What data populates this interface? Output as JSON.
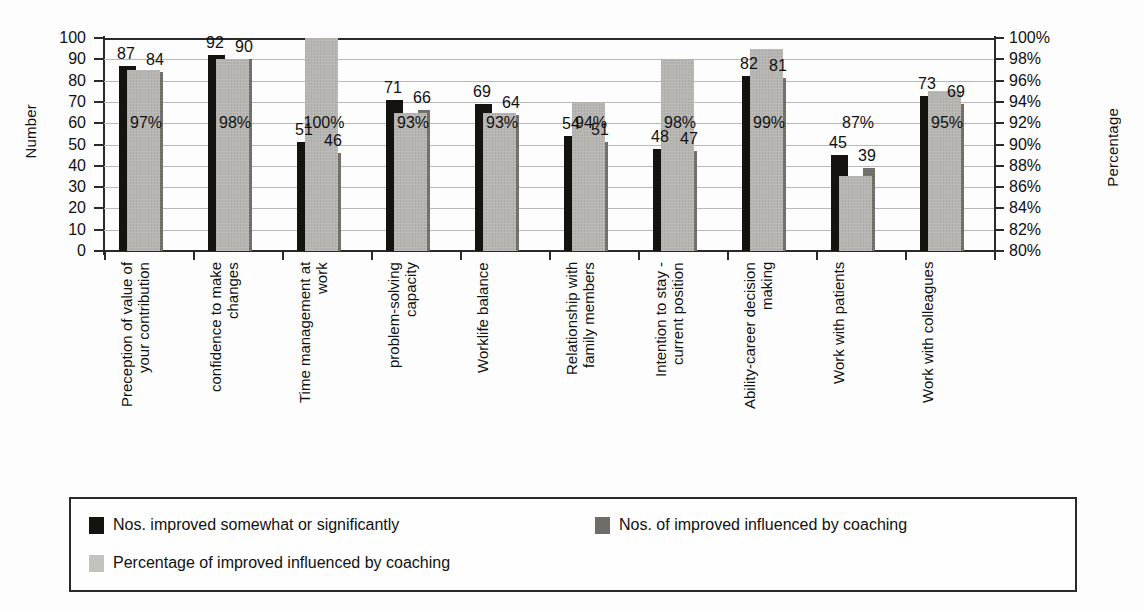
{
  "chart_data": {
    "type": "bar",
    "title": "",
    "subtitle": "",
    "xlabel": "",
    "ylabel": "Number",
    "y2label": "Percentage",
    "ylim": [
      0,
      100
    ],
    "y2lim": [
      80,
      100
    ],
    "ytick_step": 10,
    "y2tick_step": 2,
    "grid": true,
    "legend_position": "bottom",
    "yticks": [
      "100",
      "90",
      "80",
      "70",
      "60",
      "50",
      "40",
      "30",
      "20",
      "10",
      "0"
    ],
    "y2ticks": [
      "100%",
      "98%",
      "96%",
      "94%",
      "92%",
      "90%",
      "88%",
      "86%",
      "84%",
      "82%",
      "80%"
    ],
    "categories": [
      "Preception of value of\nyour contribution",
      "confidence to make\nchanges",
      "Time management at\nwork",
      "problem-solving\ncapacity",
      "Worklife balance",
      "Relationship with\nfamily members",
      "Intention to stay -\ncurrent position",
      "Ability-career decision\nmaking",
      "Work with patients",
      "Work with colleagues"
    ],
    "series": [
      {
        "name": "Nos. improved somewhat or significantly",
        "axis": "left",
        "color": "#15130f",
        "values": [
          87,
          92,
          51,
          71,
          69,
          54,
          48,
          82,
          45,
          73
        ]
      },
      {
        "name": "Nos. of improved influenced by coaching",
        "axis": "left",
        "color": "#6e6d68",
        "values": [
          84,
          90,
          46,
          66,
          64,
          51,
          47,
          81,
          39,
          69
        ]
      },
      {
        "name": "Percentage of improved influenced by coaching",
        "axis": "right",
        "color": "#b5b4b0",
        "values": [
          97,
          98,
          100,
          93,
          93,
          94,
          98,
          99,
          87,
          95
        ],
        "value_labels": [
          "97%",
          "98%",
          "100%",
          "93%",
          "93%",
          "94%",
          "98%",
          "99%",
          "87%",
          "95%"
        ]
      }
    ],
    "bar_value_labels": {
      "series1": [
        "87",
        "92",
        "51",
        "71",
        "69",
        "54",
        "48",
        "82",
        "45",
        "73"
      ],
      "series2": [
        "84",
        "90",
        "46",
        "66",
        "64",
        "51",
        "47",
        "81",
        "39",
        "69"
      ]
    }
  },
  "legend": {
    "items": [
      {
        "label": "Nos. improved somewhat or significantly",
        "swatch": "black"
      },
      {
        "label": "Nos. of improved influenced by coaching",
        "swatch": "darkgray"
      },
      {
        "label": "Percentage of improved influenced by coaching",
        "swatch": "lightgray"
      }
    ]
  }
}
